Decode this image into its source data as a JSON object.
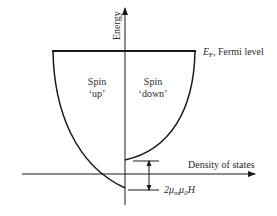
{
  "diagram": {
    "axes": {
      "y_label": "Energy",
      "x_label": "Density of states"
    },
    "fermi": {
      "symbol": "E",
      "subscript": "F",
      "label": ", Fermi level"
    },
    "regions": {
      "up": {
        "line1": "Spin",
        "line2": "‘up’"
      },
      "down": {
        "line1": "Spin",
        "line2": "‘down’"
      }
    },
    "splitting": {
      "prefix": "2μ",
      "sub1": "m",
      "mid": "μ",
      "sub2": "0",
      "suffix": "H"
    },
    "colors": {
      "line": "#1a1a1a",
      "text": "#2a2a2a",
      "background": "#ffffff"
    }
  }
}
